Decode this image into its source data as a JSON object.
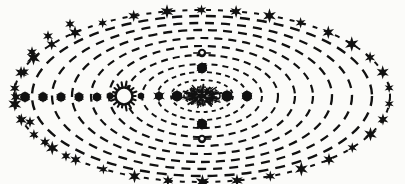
{
  "figure": {
    "title": "Geocentric Orbital System Diagram",
    "style": "vintage engraving",
    "background_color": "#fbfbf9",
    "ink_color": "#111111",
    "width": 405,
    "height": 184,
    "center_x": 202,
    "center_y": 96
  },
  "diagram_data": {
    "type": "orbital-diagram",
    "description": "Concentric dashed elliptical orbits around a central scribbled core, with star markers on the outermost ring and filled planet dots on inner rings.",
    "orbits": [
      {
        "index": 1,
        "name": "orbit-1",
        "rx": 18,
        "ry": 9,
        "dash": "3 3",
        "stroke_width": 1.6
      },
      {
        "index": 2,
        "name": "orbit-2",
        "rx": 31,
        "ry": 16,
        "dash": "4 4",
        "stroke_width": 1.8
      },
      {
        "index": 3,
        "name": "orbit-3",
        "rx": 45,
        "ry": 24,
        "dash": "5 4",
        "stroke_width": 1.9
      },
      {
        "index": 4,
        "name": "orbit-4",
        "rx": 60,
        "ry": 32,
        "dash": "6 5",
        "stroke_width": 2.0
      },
      {
        "index": 5,
        "name": "orbit-5",
        "rx": 76,
        "ry": 41,
        "dash": "7 5",
        "stroke_width": 2.1
      },
      {
        "index": 6,
        "name": "orbit-6",
        "rx": 93,
        "ry": 50,
        "dash": "8 6",
        "stroke_width": 2.2
      },
      {
        "index": 7,
        "name": "orbit-7",
        "rx": 111,
        "ry": 58,
        "dash": "8 6",
        "stroke_width": 2.2
      },
      {
        "index": 8,
        "name": "orbit-8",
        "rx": 130,
        "ry": 66,
        "dash": "9 6",
        "stroke_width": 2.3
      },
      {
        "index": 9,
        "name": "orbit-9",
        "rx": 150,
        "ry": 73,
        "dash": "9 7",
        "stroke_width": 2.3
      },
      {
        "index": 10,
        "name": "orbit-10",
        "rx": 170,
        "ry": 80,
        "dash": "10 7",
        "stroke_width": 2.4
      },
      {
        "index": 11,
        "name": "orbit-outermost-star-ring",
        "rx": 188,
        "ry": 86,
        "dash": "5 7",
        "stroke_width": 2.0
      }
    ],
    "star_ring": {
      "name": "fixed-star-ring",
      "orbit_index": 11,
      "count": 34,
      "glyph": "star-burst",
      "size": 6.5,
      "color": "#111111"
    },
    "planet_dots": [
      {
        "name": "planet-dot-left-1",
        "x": 25,
        "y": 97,
        "r": 5.2,
        "style": "filled"
      },
      {
        "name": "planet-dot-left-2",
        "x": 43,
        "y": 97,
        "r": 5.0,
        "style": "filled"
      },
      {
        "name": "planet-dot-left-3",
        "x": 61,
        "y": 97,
        "r": 4.8,
        "style": "filled"
      },
      {
        "name": "planet-dot-left-4",
        "x": 79,
        "y": 97,
        "r": 4.8,
        "style": "filled"
      },
      {
        "name": "planet-dot-left-5",
        "x": 97,
        "y": 97,
        "r": 4.6,
        "style": "filled"
      },
      {
        "name": "planet-dot-left-6",
        "x": 110,
        "y": 96,
        "r": 3.6,
        "style": "filled"
      },
      {
        "name": "planet-dot-inner-1",
        "x": 141,
        "y": 96,
        "r": 3.4,
        "style": "filled"
      },
      {
        "name": "planet-dot-inner-2",
        "x": 159,
        "y": 96,
        "r": 4.4,
        "style": "spiked"
      },
      {
        "name": "planet-dot-inner-3",
        "x": 177,
        "y": 96,
        "r": 5.6,
        "style": "filled"
      },
      {
        "name": "planet-dot-right-1",
        "x": 227,
        "y": 96,
        "r": 5.8,
        "style": "filled"
      },
      {
        "name": "planet-dot-right-2",
        "x": 247,
        "y": 96,
        "r": 5.4,
        "style": "filled"
      },
      {
        "name": "planet-dot-top",
        "x": 202,
        "y": 68,
        "r": 5.4,
        "style": "filled"
      },
      {
        "name": "planet-dot-bottom",
        "x": 202,
        "y": 124,
        "r": 5.4,
        "style": "filled"
      },
      {
        "name": "moon-dot-top",
        "x": 202,
        "y": 53,
        "r": 4.2,
        "style": "ringed"
      },
      {
        "name": "moon-dot-bottom",
        "x": 202,
        "y": 139,
        "r": 4.2,
        "style": "ringed"
      }
    ],
    "sun": {
      "name": "sun-symbol",
      "x": 124,
      "y": 96,
      "radius": 8.5,
      "ray_count": 18,
      "ray_length": 4.5,
      "fill": "#fbfbf9",
      "stroke": "#111111"
    },
    "core": {
      "name": "central-core",
      "x": 202,
      "y": 96,
      "rx": 23,
      "ry": 13,
      "texture": "scribble-starburst",
      "color": "#111111"
    },
    "outer_ring_dots": {
      "name": "outer-ring-planet-dots",
      "description": "Filled dots sitting on orbits 6-10 at the left and right extremes",
      "dots": [
        {
          "x": 16,
          "y": 97,
          "r": 5.4
        },
        {
          "x": 24,
          "y": 72,
          "r": 5.0
        },
        {
          "x": 32,
          "y": 52,
          "r": 5.0
        },
        {
          "x": 48,
          "y": 36,
          "r": 5.0
        },
        {
          "x": 70,
          "y": 24,
          "r": 4.8
        },
        {
          "x": 30,
          "y": 122,
          "r": 5.0
        },
        {
          "x": 45,
          "y": 142,
          "r": 5.0
        },
        {
          "x": 66,
          "y": 156,
          "r": 4.8
        }
      ]
    }
  },
  "labels": {
    "caption": ""
  }
}
